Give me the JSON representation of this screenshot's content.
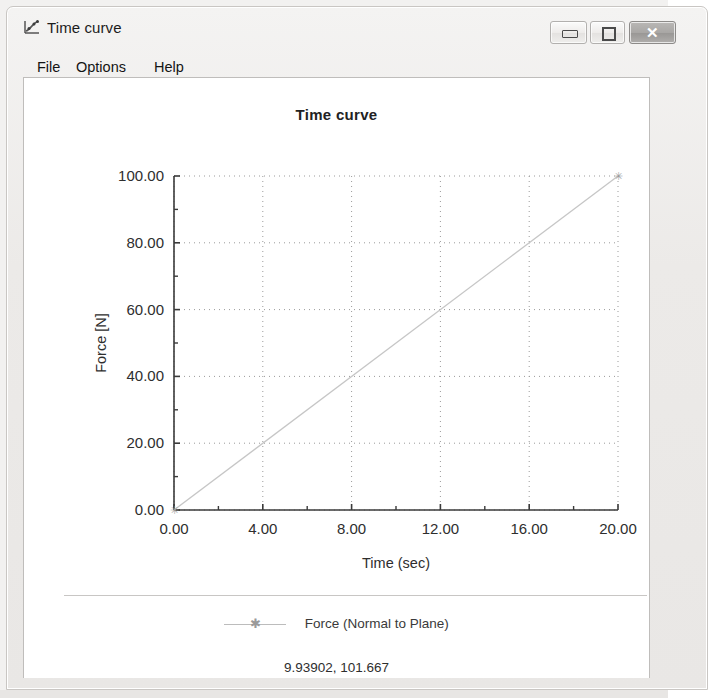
{
  "window": {
    "title": "Time curve",
    "icon": "chart-curve-icon",
    "controls": {
      "minimize": {
        "name": "minimize-button",
        "glyph": "—"
      },
      "maximize": {
        "name": "maximize-button",
        "glyph": "□"
      },
      "close": {
        "name": "close-button",
        "glyph": "✕"
      }
    }
  },
  "menubar": {
    "items": [
      {
        "label": "File"
      },
      {
        "label": "Options"
      },
      {
        "label": "Help"
      }
    ]
  },
  "legend": {
    "entries": [
      {
        "label": "Force (Normal to Plane)",
        "marker": "star-marker",
        "color": "#bcbcbc"
      }
    ]
  },
  "status": {
    "readout": "9.93902, 101.667"
  },
  "colors": {
    "series_line": "#c6c6c6",
    "axis": "#3a3a3a",
    "grid": "#9a9a9a",
    "text": "#2e2e2e",
    "panel_bg": "#ffffff"
  },
  "chart_data": {
    "type": "line",
    "title": "Time curve",
    "xlabel": "Time (sec)",
    "ylabel": "Force [N]",
    "xlim": [
      0,
      20
    ],
    "ylim": [
      0,
      100
    ],
    "xticks": [
      0,
      4,
      8,
      12,
      16,
      20
    ],
    "xticklabels": [
      "0.00",
      "4.00",
      "8.00",
      "12.00",
      "16.00",
      "20.00"
    ],
    "xminorticks": [
      2,
      6,
      10,
      14,
      18
    ],
    "yticks": [
      0,
      20,
      40,
      60,
      80,
      100
    ],
    "yticklabels": [
      "0.00",
      "20.00",
      "40.00",
      "60.00",
      "80.00",
      "100.00"
    ],
    "yminorticks": [
      10,
      30,
      50,
      70,
      90
    ],
    "grid": true,
    "grid_style": "dotted",
    "legend_position": "bottom",
    "series": [
      {
        "name": "Force (Normal to Plane)",
        "color": "#c6c6c6",
        "marker": "star",
        "x": [
          0,
          20
        ],
        "y": [
          0,
          100
        ]
      }
    ]
  }
}
